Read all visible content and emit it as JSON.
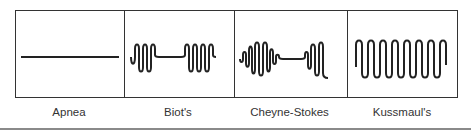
{
  "diagram": {
    "panels": [
      {
        "id": "apnea",
        "label": "Apnea",
        "pattern": "flat-line"
      },
      {
        "id": "biots",
        "label": "Biot's",
        "pattern": "burst-pause-burst"
      },
      {
        "id": "cheyne-stokes",
        "label": "Cheyne-Stokes",
        "pattern": "crescendo-decrescendo-pause"
      },
      {
        "id": "kussmauls",
        "label": "Kussmaul's",
        "pattern": "deep-rapid-regular"
      }
    ],
    "colors": {
      "stroke": "#222222",
      "border": "#333333",
      "rule": "#8a8a8a"
    }
  }
}
